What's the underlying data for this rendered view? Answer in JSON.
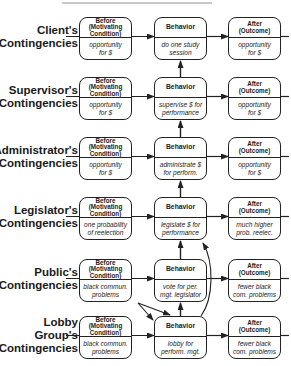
{
  "diagram": {
    "type": "contingency-chain",
    "column_headers": {
      "before": [
        "Before",
        "(Motivating",
        "Condition)"
      ],
      "behavior": [
        "Behavior"
      ],
      "after": [
        "After",
        "(Outcome)"
      ]
    },
    "rows": [
      {
        "label_lines": [
          "Client's",
          "Contingencies"
        ],
        "before": [
          "opportunity",
          "for $"
        ],
        "behavior": [
          "do one study",
          "session"
        ],
        "after": [
          "opportunity",
          "for $"
        ]
      },
      {
        "label_lines": [
          "Supervisor's",
          "Contingencies"
        ],
        "before": [
          "opportunity",
          "for $"
        ],
        "behavior": [
          "supervise $ for",
          "performance"
        ],
        "after": [
          "opportunity",
          "for $"
        ]
      },
      {
        "label_lines": [
          "Administrator's",
          "Contingencies"
        ],
        "before": [
          "opportunity",
          "for $"
        ],
        "behavior": [
          "administrate $",
          "for perform."
        ],
        "after": [
          "opportunity",
          "for $"
        ]
      },
      {
        "label_lines": [
          "Legislator's",
          "Contingencies"
        ],
        "before": [
          "one probability",
          "of reelection"
        ],
        "behavior": [
          "legislate $ for",
          "performance"
        ],
        "after": [
          "much higher",
          "prob. reelec."
        ]
      },
      {
        "label_lines": [
          "Public's",
          "Contingencies"
        ],
        "before": [
          "black commun.",
          "problems"
        ],
        "behavior": [
          "vote for per.",
          "mgt. legislator"
        ],
        "after": [
          "fewer black",
          "com. problems"
        ]
      },
      {
        "label_lines": [
          "Lobby",
          "Group's",
          "Contingencies"
        ],
        "before": [
          "black commun.",
          "problems"
        ],
        "behavior": [
          "lobby for",
          "perform. mgt."
        ],
        "after": [
          "fewer black",
          "com. problems"
        ]
      }
    ],
    "colors": {
      "line": "#222222",
      "background": "#ffffff",
      "text": "#1a1a1a"
    }
  }
}
